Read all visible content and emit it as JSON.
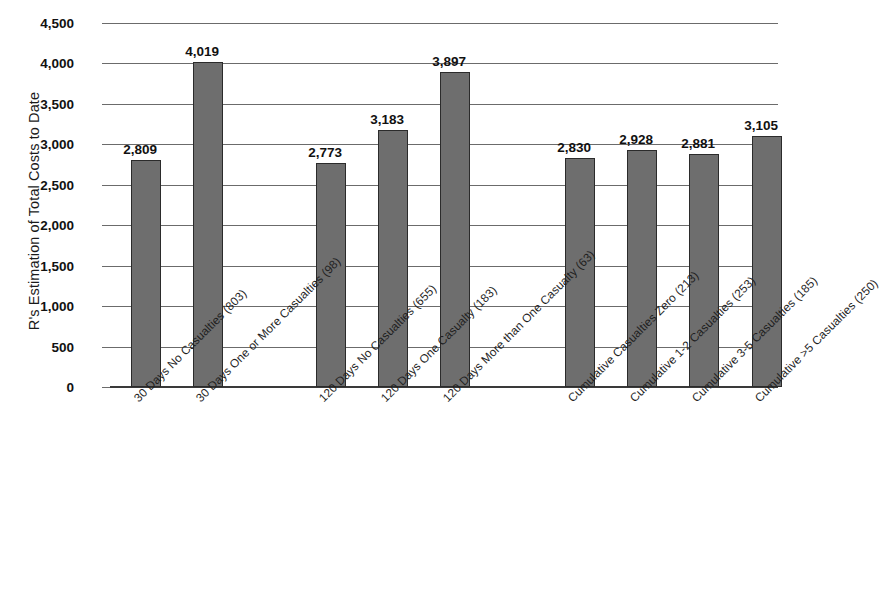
{
  "chart_data": {
    "type": "bar",
    "title": "",
    "xlabel": "",
    "ylabel": "R's Estimation of Total Costs to Date",
    "ylim": [
      0,
      4500
    ],
    "ytick_step": 500,
    "grid": true,
    "legend": "none",
    "ytick_labels": [
      "4,500",
      "4,000",
      "3,500",
      "3,000",
      "2,500",
      "2,000",
      "1,500",
      "1,000",
      "500",
      "0"
    ],
    "ytick_values": [
      4500,
      4000,
      3500,
      3000,
      2500,
      2000,
      1500,
      1000,
      500,
      0
    ],
    "categories": [
      "30 Days No Casualties (803)",
      "30 Days One or More Casualties (98)",
      "120 Days No Casualties (655)",
      "120 Days One Casualty (183)",
      "120 Days More than One Casualty (63)",
      "Cumulative Casualties Zero (213)",
      "Cumulative 1-2 Casualties (253)",
      "Cumulative 3-5 Casualties (185)",
      "Cumulative >5 Casualties (250)"
    ],
    "values": [
      2809,
      4019,
      2773,
      3183,
      3897,
      2830,
      2928,
      2881,
      3105
    ],
    "value_labels": [
      "2,809",
      "4,019",
      "2,773",
      "3,183",
      "3,897",
      "2,830",
      "2,928",
      "2,881",
      "3,105"
    ],
    "bar_color": "#6e6e6e",
    "bar_border_color": "#2b2b2b",
    "grid_color": "#6b6b6b",
    "axis_color": "#3a3a3a",
    "background": "#ffffff"
  }
}
